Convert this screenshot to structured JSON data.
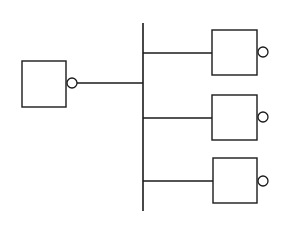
{
  "diagram": {
    "stroke_color": "#1a1a1a",
    "background": "#ffffff",
    "bus": {
      "x": 143,
      "y1": 23,
      "y2": 211
    },
    "source": {
      "box": {
        "x": 22,
        "y": 61,
        "w": 44,
        "h": 46
      },
      "bubble": {
        "cx": 72,
        "cy": 83,
        "r": 5
      },
      "wire": {
        "x1": 77,
        "y": 83,
        "x2": 143
      }
    },
    "loads": [
      {
        "box": {
          "x": 212,
          "y": 30,
          "w": 45,
          "h": 45
        },
        "bubble": {
          "cx": 263,
          "cy": 52,
          "r": 5
        },
        "wire": {
          "x1": 143,
          "y": 53,
          "x2": 212
        }
      },
      {
        "box": {
          "x": 212,
          "y": 95,
          "w": 45,
          "h": 45
        },
        "bubble": {
          "cx": 263,
          "cy": 117,
          "r": 5
        },
        "wire": {
          "x1": 143,
          "y": 118,
          "x2": 212
        }
      },
      {
        "box": {
          "x": 213,
          "y": 158,
          "w": 44,
          "h": 45
        },
        "bubble": {
          "cx": 263,
          "cy": 181,
          "r": 5
        },
        "wire": {
          "x1": 143,
          "y": 181,
          "x2": 213
        }
      }
    ]
  }
}
